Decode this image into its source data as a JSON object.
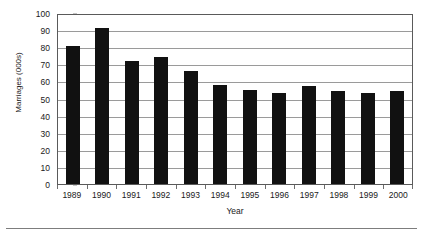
{
  "page": {
    "top_clipped_title": "",
    "footer_divider": "horizontal-rule"
  },
  "chart_data": {
    "type": "bar",
    "title": "",
    "xlabel": "Year",
    "ylabel": "Marriages (000s)",
    "ylim": [
      0,
      100
    ],
    "ytick_step": 10,
    "grid": true,
    "legend": "none",
    "bar_color": "#111111",
    "categories": [
      "1989",
      "1990",
      "1991",
      "1992",
      "1993",
      "1994",
      "1995",
      "1996",
      "1997",
      "1998",
      "1999",
      "2000"
    ],
    "values": [
      81,
      91.5,
      72,
      74,
      66,
      58,
      55,
      53.5,
      57.5,
      54.5,
      53.5,
      54.5
    ],
    "yticks": [
      "0",
      "10",
      "20",
      "30",
      "40",
      "50",
      "60",
      "70",
      "80",
      "90",
      "100"
    ],
    "series": [
      {
        "name": "Marriages",
        "values": [
          81,
          91.5,
          72,
          74,
          66,
          58,
          55,
          53.5,
          57.5,
          54.5,
          53.5,
          54.5
        ]
      }
    ]
  }
}
